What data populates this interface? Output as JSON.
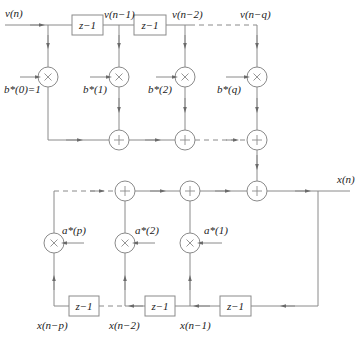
{
  "diagram": {
    "input_label": "v(n)",
    "output_label": "x(n)",
    "delay_label": "z−1",
    "top_taps": [
      {
        "label": "v(n)",
        "coef": "b*(0)=1"
      },
      {
        "label": "v(n−1)",
        "coef": "b*(1)"
      },
      {
        "label": "v(n−2)",
        "coef": "b*(2)"
      },
      {
        "label": "v(n−q)",
        "coef": "b*(q)"
      }
    ],
    "bottom_taps": [
      {
        "label": "x(n−p)",
        "coef": "a*(p)"
      },
      {
        "label": "x(n−2)",
        "coef": "a*(2)"
      },
      {
        "label": "x(n−1)",
        "coef": "a*(1)"
      }
    ],
    "multiplier_symbol": "×",
    "adder_symbol": "+"
  }
}
